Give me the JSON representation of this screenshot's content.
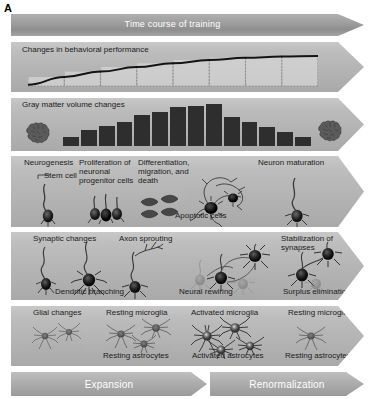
{
  "panel": {
    "letter": "A"
  },
  "timecourse": {
    "title": "Time course of training"
  },
  "behavior": {
    "title": "Changes in behavioral performance"
  },
  "gray_matter": {
    "title": "Gray matter volume changes",
    "brain_left_icon": "brain-icon",
    "brain_right_icon": "brain-icon"
  },
  "neurogenesis": {
    "labels": {
      "row_title": "Neurogenesis",
      "stem_cell": "Stem cell",
      "proliferation": "Proliferation of\nneuronal\nprogenitor cells",
      "differentiation": "Differentiation,\nmigration, and\ndeath",
      "apoptotic": "Apoptotic cells",
      "maturation": "Neuron maturation"
    }
  },
  "synaptic": {
    "labels": {
      "row_title": "Synaptic changes",
      "dendritic": "Dendritic branching",
      "axon": "Axon sprouting",
      "rewiring": "Neural rewiring",
      "stabilization": "Stabilization of\nsynapses",
      "surplus": "Surplus elimination"
    }
  },
  "glial": {
    "labels": {
      "row_title": "Glial changes",
      "resting_microglia_1": "Resting microglia",
      "resting_astrocytes_1": "Resting astrocytes",
      "activated_microglia": "Activated microglia",
      "activated_astrocytes": "Activated astrocytes",
      "resting_microglia_2": "Resting microglia",
      "resting_astrocytes_2": "Resting astrocytes"
    }
  },
  "phases": {
    "expansion": "Expansion",
    "renormalization": "Renormalization"
  },
  "colors": {
    "band_fill": "#b4b4b4",
    "timecourse_fill": "#9e9e9e",
    "bar_fill": "#2e2e2e",
    "curve_stroke": "#141414",
    "plot_fill": "#d5d5d5",
    "phase_fill": "#adadad",
    "text_dark": "#1c1c1c",
    "text_light": "#ffffff"
  },
  "chart_data": [
    {
      "type": "line",
      "title": "Changes in behavioral performance",
      "xlabel": "",
      "ylabel": "",
      "grid": true,
      "legend": "none",
      "x": [
        0,
        1,
        2,
        3,
        4,
        5,
        6,
        7,
        8
      ],
      "values": [
        4,
        28,
        45,
        59,
        71,
        81,
        88,
        92,
        94
      ],
      "ylim": [
        0,
        100
      ],
      "xlim": [
        0,
        8
      ],
      "marker_count": 9,
      "description": "Monotonic negatively-accelerated learning curve rising steeply then plateauing; dashed vertical gridlines drop from each marker to the baseline."
    },
    {
      "type": "bar",
      "title": "Gray matter volume changes",
      "xlabel": "",
      "ylabel": "",
      "grid": false,
      "legend": "none",
      "categories": [
        "1",
        "2",
        "3",
        "4",
        "5",
        "6",
        "7",
        "8",
        "9",
        "10",
        "11",
        "12",
        "13",
        "14"
      ],
      "values": [
        22,
        38,
        48,
        58,
        74,
        82,
        92,
        96,
        100,
        68,
        58,
        46,
        34,
        22
      ],
      "ylim": [
        0,
        100
      ],
      "description": "Inverted-U (expansion then renormalization) profile of gray matter volume across the training time course."
    }
  ]
}
